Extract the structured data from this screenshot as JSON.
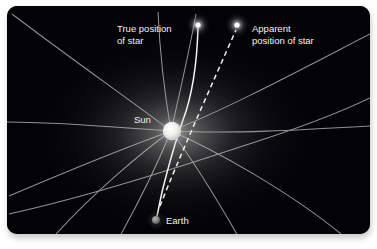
{
  "figure": {
    "name": "gravitational-lensing-diagram",
    "panel": {
      "background_color": "#020204",
      "page_background_color": "#ffffff",
      "corner_radius": 10,
      "x": 7,
      "y": 6,
      "width": 363,
      "height": 228
    },
    "labels": {
      "true_position_line1": "True position",
      "true_position_line2": "of star",
      "apparent_position_line1": "Apparent",
      "apparent_position_line2": "position of star",
      "sun": "Sun",
      "earth": "Earth"
    },
    "bodies": [
      {
        "name": "sun",
        "label": "Sun",
        "cx": 172,
        "cy": 131,
        "r": 9,
        "color": "#f4f3ef",
        "glow_color": "#cfcfcf"
      },
      {
        "name": "earth",
        "label": "Earth",
        "cx": 156,
        "cy": 220,
        "r": 4,
        "color": "#8a8a8a",
        "glow_color": "#555555"
      },
      {
        "name": "true-star",
        "label": "True position of star",
        "cx": 198,
        "cy": 25,
        "r": 3,
        "color": "#ffffff",
        "glow_color": "#e8e8f0"
      },
      {
        "name": "apparent-star",
        "label": "Apparent position of star",
        "cx": 237,
        "cy": 25,
        "r": 3,
        "color": "#ffffff",
        "glow_color": "#e8e8f0"
      }
    ],
    "rays": {
      "light_ray_color": "#f0f0f0",
      "sight_line_color": "#f0f0f0",
      "sight_line_style": "dashed",
      "grid_color": "#b9b9b9"
    }
  }
}
